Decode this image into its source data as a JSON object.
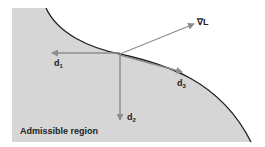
{
  "diagram": {
    "region_label": "Admissible region",
    "colors": {
      "region_fill": "#d6d6d6",
      "boundary": "#1e1e1e",
      "arrow": "#8c8c8c",
      "text": "#222222",
      "background": "#ffffff"
    },
    "vectors": [
      {
        "id": "grad",
        "base": "∇L",
        "sub": ""
      },
      {
        "id": "d1",
        "base": "d",
        "sub": "1"
      },
      {
        "id": "d2",
        "base": "d",
        "sub": "2"
      },
      {
        "id": "d3",
        "base": "d",
        "sub": "3"
      }
    ]
  }
}
